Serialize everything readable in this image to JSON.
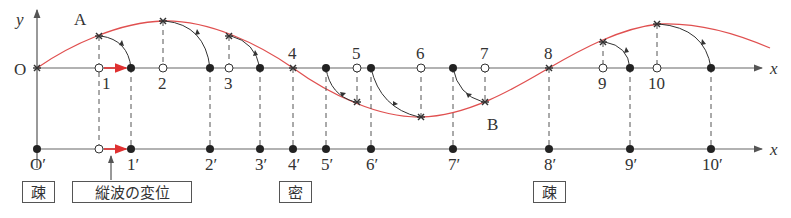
{
  "diagram": {
    "top_axis": {
      "x_label": "x",
      "y_label": "y",
      "origin_label": "O"
    },
    "bottom_axis": {
      "x_label": "x",
      "origin_label": "O′"
    },
    "points_top": [
      "1",
      "2",
      "3",
      "4",
      "5",
      "6",
      "7",
      "8",
      "9",
      "10"
    ],
    "points_bottom": [
      "1′",
      "2′",
      "3′",
      "4′",
      "5′",
      "6′",
      "7′",
      "8′",
      "9′",
      "10′"
    ],
    "point_labels": {
      "A": "A",
      "B": "B"
    },
    "boxes": {
      "sparse1": "疎",
      "displacement": "縦波の変位",
      "dense": "密",
      "sparse2": "疎"
    },
    "colors": {
      "wave": "#e05050",
      "arrow": "#e03030",
      "axis": "#555555",
      "ink": "#222222"
    }
  }
}
